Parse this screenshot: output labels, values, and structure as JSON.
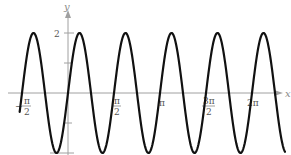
{
  "chart_data": {
    "type": "line",
    "title": "",
    "xlabel": "x",
    "ylabel": "y",
    "function": "y = 2 sin(4x)",
    "xlim": [
      -1.75,
      4.7
    ],
    "ylim": [
      -2,
      2
    ],
    "grid": false,
    "legend": null,
    "x_ticks": [
      {
        "value": -1.5708,
        "label_num": "π",
        "label_den": "2",
        "sign": "−"
      },
      {
        "value": 1.5708,
        "label_num": "π",
        "label_den": "2",
        "sign": ""
      },
      {
        "value": 3.1416,
        "label": "π"
      },
      {
        "value": 4.7124,
        "label_num": "3π",
        "label_den": "2",
        "sign": ""
      },
      {
        "value": 6.2832,
        "label": "2π"
      }
    ],
    "y_ticks": [
      {
        "value": 2,
        "label": "2"
      },
      {
        "value": 1,
        "label": ""
      },
      {
        "value": -1,
        "label": ""
      },
      {
        "value": -2,
        "label": ""
      }
    ],
    "series": [
      {
        "name": "2 sin(4x)",
        "color": "#111111",
        "x": [
          -1.5708,
          -1.1781,
          -0.7854,
          -0.3927,
          0,
          0.3927,
          0.7854,
          1.1781,
          1.5708,
          1.9635,
          2.3562,
          2.7489,
          3.1416,
          3.5343,
          3.927,
          4.3197,
          4.7124,
          5.1051,
          5.4978,
          5.8905,
          6.2832,
          6.6759
        ],
        "values": [
          0,
          2,
          0,
          -2,
          0,
          2,
          0,
          -2,
          0,
          2,
          0,
          -2,
          0,
          2,
          0,
          -2,
          0,
          2,
          0,
          -2,
          0,
          2
        ]
      }
    ],
    "labels": {
      "x_axis": "x",
      "y_axis": "y",
      "y_two": "2",
      "neg_half_pi_num": "π",
      "neg_half_pi_den": "2",
      "neg_sign": "−",
      "half_pi_num": "π",
      "half_pi_den": "2",
      "pi": "π",
      "three_half_pi_num": "3π",
      "three_half_pi_den": "2",
      "two_pi": "2π"
    },
    "colors": {
      "curve": "#111111",
      "axis": "#9a9a9a",
      "text": "#555555"
    }
  }
}
